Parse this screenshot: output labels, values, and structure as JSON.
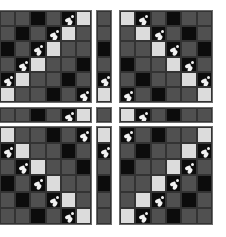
{
  "figure": {
    "shades": {
      "D": "#505050",
      "B": "#0c0c0c",
      "L": "#dcdcdc"
    },
    "panels": {
      "top_left": [
        [
          "D",
          "D",
          "B",
          "D",
          "B*",
          "L"
        ],
        [
          "D",
          "B",
          "D",
          "B*",
          "L",
          "D"
        ],
        [
          "B",
          "D",
          "B*",
          "L",
          "D",
          "D"
        ],
        [
          "D",
          "B*",
          "L",
          "D",
          "D",
          "B"
        ],
        [
          "B*",
          "L",
          "D",
          "D",
          "B",
          "D"
        ],
        [
          "L",
          "D",
          "D",
          "B",
          "D",
          "B*"
        ]
      ],
      "top_right": [
        [
          "L",
          "B*",
          "D",
          "B",
          "D",
          "D"
        ],
        [
          "D",
          "L",
          "B*",
          "D",
          "B",
          "D"
        ],
        [
          "D",
          "D",
          "L",
          "B*",
          "D",
          "B"
        ],
        [
          "B",
          "D",
          "D",
          "L",
          "B*",
          "D"
        ],
        [
          "D",
          "B",
          "D",
          "D",
          "L",
          "B*"
        ],
        [
          "B*",
          "D",
          "B",
          "D",
          "D",
          "L"
        ]
      ],
      "bottom_left": [
        [
          "L",
          "D",
          "D",
          "B",
          "D",
          "B*"
        ],
        [
          "B*",
          "L",
          "D",
          "D",
          "B",
          "D"
        ],
        [
          "D",
          "B*",
          "L",
          "D",
          "D",
          "B"
        ],
        [
          "B",
          "D",
          "B*",
          "L",
          "D",
          "D"
        ],
        [
          "D",
          "B",
          "D",
          "B*",
          "L",
          "D"
        ],
        [
          "D",
          "D",
          "B",
          "D",
          "B*",
          "L"
        ]
      ],
      "bottom_right": [
        [
          "B*",
          "D",
          "B",
          "D",
          "D",
          "L"
        ],
        [
          "D",
          "B",
          "D",
          "D",
          "L",
          "B*"
        ],
        [
          "B",
          "D",
          "D",
          "L",
          "B*",
          "D"
        ],
        [
          "D",
          "D",
          "L",
          "B*",
          "D",
          "B"
        ],
        [
          "D",
          "L",
          "B*",
          "D",
          "B",
          "D"
        ],
        [
          "L",
          "B*",
          "D",
          "B",
          "D",
          "D"
        ]
      ],
      "strip_v_top": [
        [
          "D"
        ],
        [
          "D"
        ],
        [
          "B"
        ],
        [
          "D"
        ],
        [
          "B*"
        ],
        [
          "L"
        ]
      ],
      "strip_v_bottom": [
        [
          "L"
        ],
        [
          "B*"
        ],
        [
          "D"
        ],
        [
          "B"
        ],
        [
          "D"
        ],
        [
          "D"
        ]
      ],
      "strip_h_left": [
        [
          "D",
          "D",
          "B",
          "D",
          "B*",
          "L"
        ]
      ],
      "strip_h_right": [
        [
          "L",
          "B*",
          "D",
          "B",
          "D",
          "D"
        ]
      ],
      "center": [
        [
          "D"
        ]
      ]
    }
  }
}
